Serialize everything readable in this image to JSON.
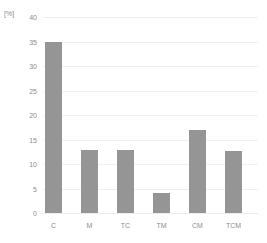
{
  "chart_data": {
    "type": "bar",
    "title": "",
    "subtitle": "",
    "xlabel": "",
    "ylabel": "[%]",
    "unit_label": "[%]",
    "categories": [
      "C",
      "M",
      "TC",
      "TM",
      "CM",
      "TCM"
    ],
    "values": [
      35.0,
      12.9,
      12.8,
      4.1,
      17.0,
      12.7
    ],
    "series": [
      {
        "name": "",
        "values": [
          35.0,
          12.9,
          12.8,
          4.1,
          17.0,
          12.7
        ]
      }
    ],
    "ylim": [
      0,
      40
    ],
    "xlim": [
      0,
      6
    ],
    "ytick_labels": [
      "40",
      "35",
      "30",
      "25",
      "20",
      "15",
      "10",
      "5",
      "0"
    ],
    "ytick_values": [
      40,
      35,
      30,
      25,
      20,
      15,
      10,
      5,
      0
    ],
    "ytick_step": 5,
    "grid": true,
    "grid_axis": "y",
    "legend": false,
    "legend_position": "none",
    "bar_color": "#959595",
    "grid_color": "#f0f0f0",
    "background_color": "#ffffff",
    "text_color": "#8e8e8e"
  }
}
